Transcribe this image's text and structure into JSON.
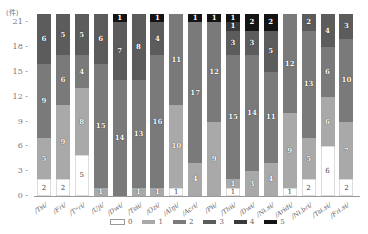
{
  "chart_data": {
    "type": "bar",
    "stacked": true,
    "title": "",
    "xlabel": "",
    "ylabel": "(件)",
    "ylim": [
      0,
      22
    ],
    "yticks": [
      0,
      3,
      6,
      9,
      12,
      15,
      18,
      21
    ],
    "grid": false,
    "legend_position": "bottom",
    "categories": [
      "/Tsɨ/",
      "/Fɾɨ/",
      "/Tʷɾɨ/",
      "/Ujɨ/",
      "/Dwɨ/",
      "/Tsɨɨ/",
      "/Ozɨ/",
      "/Alŋɨ/",
      "/Acɾɨ/",
      "/Pɨɨ/",
      "/Thɨɨ/",
      "/Dwɨ/",
      "/Nɨ.sɨ/",
      "/Arɨdɨ/",
      "/Nɨ.bɾɨ/",
      "/Tsɨ.sɨ/",
      "/Fɾɨ.sɨ/"
    ],
    "series": [
      {
        "name": "0",
        "color": "#ffffff",
        "values": [
          2,
          2,
          5,
          0,
          0,
          0,
          0,
          1,
          0,
          0,
          1,
          0,
          0,
          1,
          2,
          6,
          2
        ]
      },
      {
        "name": "1",
        "color": "#a9a9a9",
        "values": [
          5,
          9,
          8,
          1,
          0,
          1,
          1,
          10,
          4,
          9,
          1,
          3,
          4,
          9,
          5,
          6,
          7
        ]
      },
      {
        "name": "2",
        "color": "#7a7a7a",
        "values": [
          9,
          6,
          4,
          15,
          14,
          13,
          16,
          11,
          17,
          12,
          15,
          14,
          11,
          12,
          13,
          6,
          10
        ]
      },
      {
        "name": "3",
        "color": "#5c5c5c",
        "values": [
          6,
          5,
          5,
          6,
          7,
          8,
          4,
          0,
          0,
          0,
          3,
          3,
          5,
          0,
          2,
          4,
          3
        ]
      },
      {
        "name": "4",
        "color": "#3a3a3a",
        "values": [
          0,
          0,
          0,
          0,
          0,
          0,
          0,
          0,
          0,
          0,
          1,
          0,
          0,
          0,
          0,
          0,
          0
        ]
      },
      {
        "name": "5",
        "color": "#141414",
        "values": [
          0,
          0,
          0,
          0,
          1,
          0,
          1,
          0,
          1,
          1,
          1,
          2,
          2,
          0,
          0,
          0,
          0
        ]
      }
    ]
  }
}
